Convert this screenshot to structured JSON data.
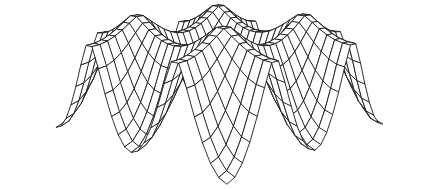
{
  "figure": {
    "background": "#ffffff"
  },
  "chart_data": {
    "type": "surface-wireframe",
    "title": "",
    "xlabel": "",
    "ylabel": "",
    "zlabel": "",
    "legend": null,
    "grid": "wireframe-mesh",
    "formula": "z = -amplitude * sqrt(sin(pi*x)^2 + sin(pi*y)^2 + k * sin(pi*x)^2 * sin(pi*y)^2) / sqrt(2 + k)",
    "k": 23,
    "amplitude": 1.0,
    "x_range": [
      -0.5,
      1.5
    ],
    "y_range": [
      -0.5,
      1.5
    ],
    "grid_divisions": 26,
    "feature_points": {
      "sharp_peaks_z0_at": [
        [
          0,
          0
        ],
        [
          0,
          1
        ],
        [
          1,
          0
        ],
        [
          1,
          1
        ]
      ],
      "ridge_saddle_z": -0.2,
      "bowl_minimum_z": -1.0,
      "bowl_centers_at": [
        [
          -0.5,
          -0.5
        ],
        [
          0.5,
          0.5
        ],
        [
          -0.5,
          1.5
        ],
        [
          1.5,
          -0.5
        ],
        [
          0.5,
          -0.5
        ],
        [
          -0.5,
          0.5
        ],
        [
          1.5,
          0.5
        ],
        [
          0.5,
          1.5
        ],
        [
          1.5,
          1.5
        ]
      ],
      "visible_apexes_screen_px": [
        [
          118,
          8
        ],
        [
          253,
          30
        ]
      ],
      "hanging_corners_screen_px": [
        [
          65,
          112
        ],
        [
          225,
          183
        ],
        [
          425,
          95
        ]
      ]
    },
    "view": {
      "azimuth_deg": 47,
      "elevation_deg": 8,
      "perspective_distance": 5.5,
      "projection": "perspective",
      "hidden_line_removal": true
    },
    "style": {
      "stroke_color": "#1a1a1a",
      "stroke_width": 0.9,
      "fill_color": "#ffffff",
      "background": "#ffffff"
    },
    "canvas": {
      "width": 439,
      "height": 189,
      "margin": 5
    }
  }
}
